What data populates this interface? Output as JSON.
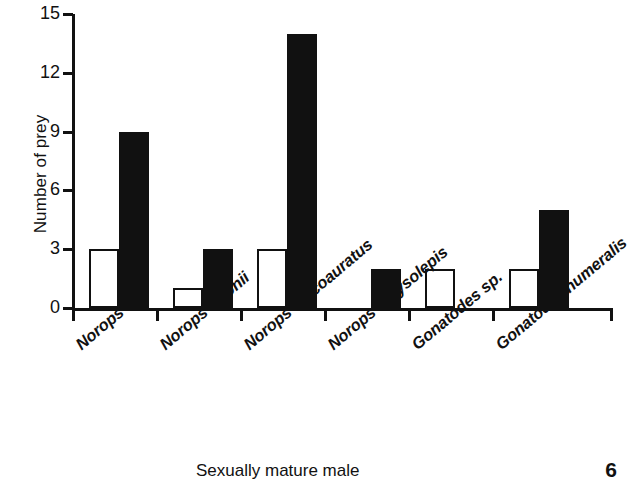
{
  "chart_data": {
    "type": "bar",
    "title": "",
    "subtitle": "",
    "xlabel": "Sexually mature male",
    "ylabel": "Number of prey",
    "categories": [
      "Norops sp.",
      "Norops ortonii",
      "Norops fuscoauratus",
      "Norops chrysolepis",
      "Gonatodes sp.",
      "Gonatodes humeralis"
    ],
    "series": [
      {
        "name": "open",
        "style": "white-fill-black-outline",
        "values": [
          3,
          1,
          3,
          0,
          2,
          2
        ]
      },
      {
        "name": "filled",
        "style": "solid-black",
        "values": [
          9,
          3,
          14,
          2,
          0,
          5
        ]
      }
    ],
    "ylim": [
      0,
      15
    ],
    "yticks": [
      0,
      3,
      6,
      9,
      12,
      15
    ],
    "ytick_labels": [
      "0",
      "3",
      "6",
      "9",
      "12",
      "15"
    ],
    "grid": false,
    "legend": "none",
    "bar_color_open": "#ffffff",
    "bar_color_filled": "#111111",
    "axis_color": "#111111"
  },
  "figure": {
    "number": "6",
    "x_axis_title": "Sexually mature male",
    "y_axis_title": "Number of prey"
  }
}
